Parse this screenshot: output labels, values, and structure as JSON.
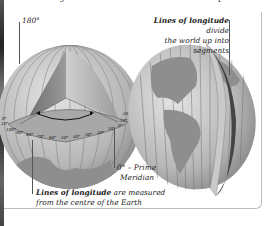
{
  "intro_text": "Lines of longitude measure how far east or west a place is.",
  "labels": {
    "deg_180": "180°",
    "divide_line1_bold": "Lines of longitude",
    "divide_line1_rest": " divide",
    "divide_line2": "the world up into segments",
    "prime_line1": "0° – Prime",
    "prime_line2": "Meridian",
    "measured_line1_bold": "Lines of longitude",
    "measured_line1_rest": " are measured",
    "measured_line2": "from the centre of the Earth"
  },
  "degree_ticks": [
    "0°",
    "10°",
    "100°",
    "90°",
    "80°",
    "70°",
    "60°",
    "50°",
    "40°",
    "30°",
    "20°",
    "10°",
    "0°",
    "10°",
    "20°"
  ],
  "colors": {
    "globe_sea": "#bdbdbd",
    "globe_land": "#8e8e8e",
    "frame": "#bdbdbd",
    "text": "#222222"
  }
}
